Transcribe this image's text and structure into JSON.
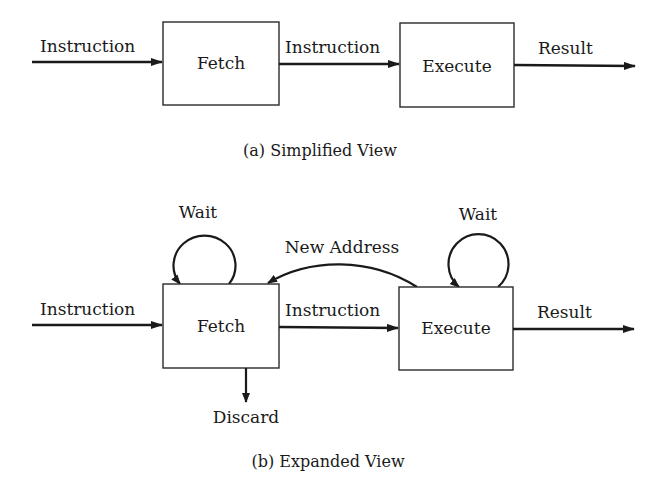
{
  "diagrams": {
    "simplified": {
      "caption": "(a) Simplified View",
      "boxes": {
        "fetch": "Fetch",
        "execute": "Execute"
      },
      "edges": {
        "input": "Instruction",
        "fetch_to_execute": "Instruction",
        "output": "Result"
      }
    },
    "expanded": {
      "caption": "(b) Expanded View",
      "boxes": {
        "fetch": "Fetch",
        "execute": "Execute"
      },
      "edges": {
        "input": "Instruction",
        "fetch_to_execute": "Instruction",
        "output": "Result",
        "fetch_wait": "Wait",
        "execute_wait": "Wait",
        "new_address": "New Address",
        "discard": "Discard"
      }
    }
  }
}
